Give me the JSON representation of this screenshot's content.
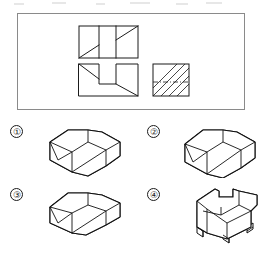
{
  "problem": {
    "type": "orthographic-to-isometric-matching",
    "frame": {
      "label": "projection-views-frame"
    },
    "views": [
      {
        "id": "top-view",
        "name": "Top view",
        "position": "upper-left",
        "outline": "rectangle",
        "x": 78,
        "y": 25,
        "w": 59,
        "h": 32,
        "panels": 3,
        "features": "three vertical panels; diagonal line in left panel rising left-to-right; diagonal line in right panel rising left-to-right"
      },
      {
        "id": "front-view",
        "name": "Front view",
        "position": "lower-left",
        "outline": "notched-rectangle",
        "x": 78,
        "y": 63,
        "w": 59,
        "h": 32,
        "features": "central rectangular notch open at top; diagonal from upper-left corner down to notch; diagonal from notch bottom-right down to lower-right corner"
      },
      {
        "id": "side-view",
        "name": "Side section view",
        "position": "lower-right",
        "outline": "square",
        "x": 152,
        "y": 63,
        "w": 36,
        "h": 32,
        "features": "full section hatching at 45 degrees; horizontal dash-dot centerline across middle"
      }
    ],
    "options": [
      {
        "number": "①",
        "id": "option-1",
        "label": "Option 1",
        "description": "isometric block with V-shaped wedge cut and stepped top, narrow left riser"
      },
      {
        "number": "②",
        "id": "option-2",
        "label": "Option 2",
        "description": "isometric block with V-shaped wedge cut, deeper sloped front face"
      },
      {
        "number": "③",
        "id": "option-3",
        "label": "Option 3",
        "description": "isometric block with V-shaped wedge cut, flatter lower profile"
      },
      {
        "number": "④",
        "id": "option-4",
        "label": "Option 4",
        "description": "isometric block with rectangular through channel and four legs"
      }
    ]
  },
  "colors": {
    "line": "#1b1b1b",
    "frame_border": "#8a8a8a",
    "background": "#ffffff"
  }
}
